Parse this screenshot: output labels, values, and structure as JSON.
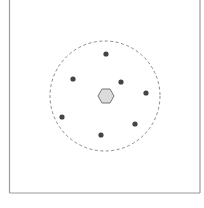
{
  "diagram": {
    "background": "#ffffff",
    "frame": {
      "x1": 9.5,
      "x2": 200,
      "y_bottom": 193,
      "stroke": "#9a9a9a",
      "width": 1.2
    },
    "boundary_circle": {
      "cx": 105,
      "cy": 96,
      "r": 55,
      "stroke": "#8a8a8a",
      "dash": "3,2.5",
      "width": 1
    },
    "center_hexagon": {
      "cx": 106,
      "cy": 96,
      "rx": 8,
      "ry": 7,
      "fill": "#dcdcdc",
      "stroke": "#777777"
    },
    "points": [
      {
        "x": 106,
        "y": 54
      },
      {
        "x": 73,
        "y": 79
      },
      {
        "x": 121,
        "y": 82
      },
      {
        "x": 146,
        "y": 93
      },
      {
        "x": 62,
        "y": 117
      },
      {
        "x": 135,
        "y": 124
      },
      {
        "x": 101,
        "y": 135
      }
    ],
    "point_style": {
      "r": 2.6,
      "fill": "#444444"
    }
  }
}
